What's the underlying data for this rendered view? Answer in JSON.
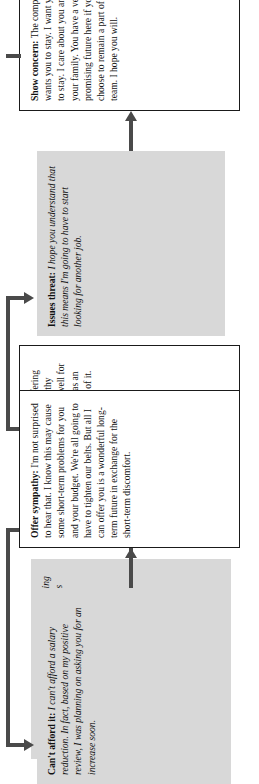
{
  "diagram": {
    "orientation": "rotated-90-ccw",
    "colors": {
      "objection_box_fill": "#d8d8d8",
      "response_box_fill": "#ffffff",
      "response_box_border": "#1a1a1a",
      "connector": "#4a4a4a",
      "text": "#111111",
      "page_background": "#ffffff"
    },
    "pairs": [
      {
        "id": "pair-1",
        "objection": {
          "label": "Quid pro quo:",
          "text": "What is the company offering in exchange for all that I'm losing with this reduction?"
        },
        "response": {
          "label": "Be frank:",
          "text": "Frankly, we're offering you employment with a healthy company that is positioned well for the coming years, and that has an extraordinary future in front of it."
        }
      },
      {
        "id": "pair-2",
        "objection": {
          "label": "Issues threat:",
          "text": "I hope you understand that this means I'm going to have to start looking for another job."
        },
        "response": {
          "label": "Show concern:",
          "text": "The company wants you to stay. I want you to stay. I care about you and your family. You have a very promising future here if you choose to remain a part of the team. I hope you will."
        }
      },
      {
        "id": "pair-3",
        "objection": {
          "label": "Can't afford it:",
          "text": "I can't afford a salary reduction. In fact, based on my positive review, I was planning on asking you for an increase soon."
        },
        "response": {
          "label": "Offer sympathy:",
          "text": "I'm not surprised to hear that. I know this may cause some short-term problems for you and your budget. We're all going to have to tighten our belts. But all I can offer you is a wonderful long-term future in exchange for the short-term discomfort."
        }
      }
    ],
    "connectors": [
      {
        "id": "arrow-objection-1-to-response-1",
        "kind": "straight-arrow",
        "direction": "right"
      },
      {
        "id": "arrow-response-1-to-objection-2",
        "kind": "elbow-arrow",
        "direction": "up"
      },
      {
        "id": "arrow-objection-2-to-response-2",
        "kind": "straight-arrow",
        "direction": "right"
      },
      {
        "id": "arrow-response-2-to-objection-3",
        "kind": "elbow-arrow",
        "direction": "up"
      },
      {
        "id": "arrow-objection-3-to-response-3",
        "kind": "straight-arrow",
        "direction": "right"
      }
    ]
  }
}
